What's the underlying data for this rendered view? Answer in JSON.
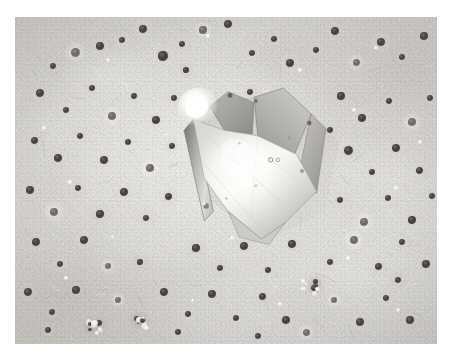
{
  "image": {
    "kind": "micrograph",
    "modality": "grayscale electron micrograph",
    "subject": "faceted crystal on textured substrate",
    "frame": {
      "x": 15,
      "y": 17,
      "width": 422,
      "height": 327
    },
    "canvas": {
      "width": 453,
      "height": 360
    },
    "border_color": "#ffffff",
    "has_text": false,
    "has_scale_bar": false,
    "alt_text": "Grayscale micrograph: a large bright faceted polyhedral crystal at center, surrounded by many small dark round particles on a mottled light-gray substrate, with two small bright rectangular fragments at lower left."
  },
  "palette": {
    "background_light": "#e3e1dd",
    "background_mid": "#d5d3cf",
    "background_dark": "#cfcdc9",
    "particle_dark": "#403d3a",
    "particle_mid": "#6a6763",
    "highlight_white": "#ffffff",
    "crystal_face": "#f6f4f0",
    "crystal_facet": "#a9a7a3",
    "crystal_edge": "#8a8884"
  },
  "objects": {
    "main_crystal": {
      "label": "main-crystal",
      "description": "Large euhedral crystal with a dominant bright rhombic face, two smaller upper facets, a narrow left edge band, and a pointed lower vertex.",
      "centroid": {
        "x": 252,
        "y": 155
      },
      "bbox": {
        "x": 183,
        "y": 83,
        "width": 145,
        "height": 150
      },
      "brightness": "high",
      "facet_count": 4
    },
    "bright_blob": {
      "label": "amorphous-bright-deposit",
      "description": "Irregular bright white deposit adhering to the upper-left shoulder of the crystal.",
      "bbox": {
        "x": 186,
        "y": 84,
        "width": 36,
        "height": 33
      }
    },
    "fragments": [
      {
        "label": "fragment-upper",
        "description": "Small bright tilted rectangular crystal fragment.",
        "bbox": {
          "x": 126,
          "y": 249,
          "width": 25,
          "height": 33
        },
        "rotation_deg": -14
      },
      {
        "label": "fragment-lower",
        "description": "Small bright rectangular crystal fragment below and right of the first.",
        "bbox": {
          "x": 150,
          "y": 272,
          "width": 26,
          "height": 38
        },
        "rotation_deg": -6
      }
    ],
    "particle_field": {
      "label": "dark-particle-field",
      "description": "Scattered sub-round dark particles distributed across the substrate.",
      "approximate_count": 96,
      "size_range_px": [
        3,
        11
      ]
    },
    "bright_clusters": [
      {
        "label": "bright-cluster-left",
        "x": 95,
        "y": 324,
        "radius": 11
      },
      {
        "label": "bright-cluster-mid",
        "x": 141,
        "y": 325,
        "radius": 9
      },
      {
        "label": "bright-cluster-right",
        "x": 310,
        "y": 287,
        "radius": 10
      }
    ]
  },
  "particles": {
    "dark": [
      {
        "x": 75,
        "y": 52,
        "r": 4.5
      },
      {
        "x": 100,
        "y": 46,
        "r": 3.8
      },
      {
        "x": 53,
        "y": 66,
        "r": 3.0
      },
      {
        "x": 122,
        "y": 40,
        "r": 3.4
      },
      {
        "x": 143,
        "y": 29,
        "r": 4.2
      },
      {
        "x": 163,
        "y": 56,
        "r": 4.6
      },
      {
        "x": 182,
        "y": 44,
        "r": 3.2
      },
      {
        "x": 203,
        "y": 30,
        "r": 3.6
      },
      {
        "x": 228,
        "y": 24,
        "r": 4.0
      },
      {
        "x": 252,
        "y": 53,
        "r": 3.3
      },
      {
        "x": 274,
        "y": 39,
        "r": 3.0
      },
      {
        "x": 290,
        "y": 63,
        "r": 4.4
      },
      {
        "x": 316,
        "y": 50,
        "r": 3.0
      },
      {
        "x": 335,
        "y": 31,
        "r": 4.0
      },
      {
        "x": 356,
        "y": 62,
        "r": 3.5
      },
      {
        "x": 381,
        "y": 42,
        "r": 4.3
      },
      {
        "x": 402,
        "y": 57,
        "r": 3.2
      },
      {
        "x": 424,
        "y": 36,
        "r": 3.6
      },
      {
        "x": 40,
        "y": 93,
        "r": 4.1
      },
      {
        "x": 66,
        "y": 110,
        "r": 3.4
      },
      {
        "x": 92,
        "y": 88,
        "r": 3.0
      },
      {
        "x": 112,
        "y": 116,
        "r": 3.8
      },
      {
        "x": 134,
        "y": 96,
        "r": 3.3
      },
      {
        "x": 156,
        "y": 120,
        "r": 4.2
      },
      {
        "x": 174,
        "y": 98,
        "r": 3.0
      },
      {
        "x": 341,
        "y": 96,
        "r": 3.6
      },
      {
        "x": 362,
        "y": 118,
        "r": 4.4
      },
      {
        "x": 389,
        "y": 101,
        "r": 3.2
      },
      {
        "x": 412,
        "y": 122,
        "r": 3.8
      },
      {
        "x": 430,
        "y": 98,
        "r": 3.0
      },
      {
        "x": 34,
        "y": 140,
        "r": 3.5
      },
      {
        "x": 58,
        "y": 158,
        "r": 4.0
      },
      {
        "x": 80,
        "y": 136,
        "r": 3.1
      },
      {
        "x": 104,
        "y": 160,
        "r": 4.3
      },
      {
        "x": 128,
        "y": 142,
        "r": 3.4
      },
      {
        "x": 150,
        "y": 168,
        "r": 3.8
      },
      {
        "x": 172,
        "y": 146,
        "r": 3.0
      },
      {
        "x": 348,
        "y": 150,
        "r": 4.5
      },
      {
        "x": 372,
        "y": 172,
        "r": 3.3
      },
      {
        "x": 396,
        "y": 148,
        "r": 3.9
      },
      {
        "x": 419,
        "y": 170,
        "r": 3.5
      },
      {
        "x": 30,
        "y": 190,
        "r": 3.7
      },
      {
        "x": 54,
        "y": 212,
        "r": 4.2
      },
      {
        "x": 78,
        "y": 188,
        "r": 3.0
      },
      {
        "x": 100,
        "y": 214,
        "r": 3.6
      },
      {
        "x": 124,
        "y": 192,
        "r": 4.0
      },
      {
        "x": 146,
        "y": 218,
        "r": 3.2
      },
      {
        "x": 168,
        "y": 196,
        "r": 3.5
      },
      {
        "x": 340,
        "y": 200,
        "r": 3.1
      },
      {
        "x": 364,
        "y": 222,
        "r": 4.4
      },
      {
        "x": 388,
        "y": 198,
        "r": 3.3
      },
      {
        "x": 412,
        "y": 220,
        "r": 3.7
      },
      {
        "x": 432,
        "y": 196,
        "r": 3.0
      },
      {
        "x": 36,
        "y": 242,
        "r": 3.9
      },
      {
        "x": 60,
        "y": 264,
        "r": 3.3
      },
      {
        "x": 84,
        "y": 240,
        "r": 4.1
      },
      {
        "x": 108,
        "y": 266,
        "r": 3.0
      },
      {
        "x": 196,
        "y": 248,
        "r": 3.6
      },
      {
        "x": 220,
        "y": 268,
        "r": 3.2
      },
      {
        "x": 244,
        "y": 246,
        "r": 4.0
      },
      {
        "x": 268,
        "y": 270,
        "r": 3.4
      },
      {
        "x": 292,
        "y": 244,
        "r": 3.8
      },
      {
        "x": 330,
        "y": 262,
        "r": 3.1
      },
      {
        "x": 354,
        "y": 240,
        "r": 4.2
      },
      {
        "x": 378,
        "y": 266,
        "r": 3.5
      },
      {
        "x": 402,
        "y": 242,
        "r": 3.0
      },
      {
        "x": 426,
        "y": 264,
        "r": 3.7
      },
      {
        "x": 28,
        "y": 292,
        "r": 4.0
      },
      {
        "x": 52,
        "y": 312,
        "r": 3.2
      },
      {
        "x": 76,
        "y": 290,
        "r": 3.6
      },
      {
        "x": 118,
        "y": 300,
        "r": 3.1
      },
      {
        "x": 164,
        "y": 292,
        "r": 3.9
      },
      {
        "x": 188,
        "y": 314,
        "r": 3.3
      },
      {
        "x": 212,
        "y": 294,
        "r": 4.1
      },
      {
        "x": 236,
        "y": 318,
        "r": 3.0
      },
      {
        "x": 262,
        "y": 296,
        "r": 3.5
      },
      {
        "x": 286,
        "y": 320,
        "r": 3.8
      },
      {
        "x": 334,
        "y": 300,
        "r": 3.2
      },
      {
        "x": 360,
        "y": 322,
        "r": 4.0
      },
      {
        "x": 386,
        "y": 298,
        "r": 3.4
      },
      {
        "x": 410,
        "y": 320,
        "r": 3.6
      },
      {
        "x": 48,
        "y": 330,
        "r": 3.0
      },
      {
        "x": 178,
        "y": 332,
        "r": 3.3
      },
      {
        "x": 258,
        "y": 336,
        "r": 3.1
      },
      {
        "x": 306,
        "y": 332,
        "r": 3.5
      },
      {
        "x": 250,
        "y": 92,
        "r": 3.0
      },
      {
        "x": 330,
        "y": 130,
        "r": 3.0
      },
      {
        "x": 186,
        "y": 70,
        "r": 2.6
      },
      {
        "x": 398,
        "y": 280,
        "r": 2.8
      },
      {
        "x": 140,
        "y": 262,
        "r": 2.6
      }
    ],
    "bright": [
      {
        "x": 108,
        "y": 60,
        "r": 2.0
      },
      {
        "x": 208,
        "y": 36,
        "r": 1.6
      },
      {
        "x": 300,
        "y": 70,
        "r": 1.8
      },
      {
        "x": 376,
        "y": 48,
        "r": 2.2
      },
      {
        "x": 44,
        "y": 128,
        "r": 1.7
      },
      {
        "x": 166,
        "y": 134,
        "r": 1.5
      },
      {
        "x": 354,
        "y": 110,
        "r": 2.0
      },
      {
        "x": 420,
        "y": 142,
        "r": 1.8
      },
      {
        "x": 70,
        "y": 182,
        "r": 1.6
      },
      {
        "x": 300,
        "y": 128,
        "r": 1.9
      },
      {
        "x": 396,
        "y": 188,
        "r": 1.7
      },
      {
        "x": 112,
        "y": 236,
        "r": 1.5
      },
      {
        "x": 232,
        "y": 238,
        "r": 1.8
      },
      {
        "x": 348,
        "y": 258,
        "r": 1.6
      },
      {
        "x": 66,
        "y": 278,
        "r": 2.0
      },
      {
        "x": 280,
        "y": 304,
        "r": 1.7
      },
      {
        "x": 398,
        "y": 310,
        "r": 1.9
      },
      {
        "x": 192,
        "y": 300,
        "r": 1.5
      },
      {
        "x": 318,
        "y": 178,
        "r": 1.6
      },
      {
        "x": 240,
        "y": 148,
        "r": 2.1
      },
      {
        "x": 252,
        "y": 150,
        "r": 1.7
      }
    ]
  }
}
